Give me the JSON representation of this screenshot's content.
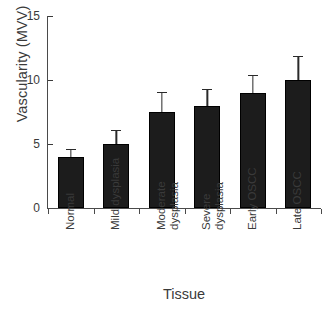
{
  "chart_data": {
    "type": "bar",
    "title": "",
    "xlabel": "Tissue",
    "ylabel": "Vascularity (MVV)",
    "categories": [
      "Normal",
      "Mild dysplasia",
      "Moderate dysplasia",
      "Severe dysplasia",
      "Early OSCC",
      "Late OSCC"
    ],
    "category_lines": [
      [
        "Normal"
      ],
      [
        "Mild dysplasia"
      ],
      [
        "Moderate",
        "dysplasia"
      ],
      [
        "Severe",
        "dysplasia"
      ],
      [
        "Early OSCC"
      ],
      [
        "Late OSCC"
      ]
    ],
    "values": [
      4.0,
      5.0,
      7.5,
      8.0,
      9.0,
      10.0
    ],
    "error_upper": [
      0.5,
      1.0,
      1.5,
      1.2,
      1.3,
      1.8
    ],
    "error_bar_tops": [
      4.5,
      6.0,
      9.0,
      9.2,
      10.3,
      11.8
    ],
    "ylim": [
      0,
      15
    ],
    "yticks": [
      0,
      5,
      10,
      15
    ],
    "ytick_labels": [
      "0",
      "5",
      "10",
      "15"
    ],
    "grid": false,
    "legend": false,
    "bar_color": "#1c1c1c",
    "axis_color": "#4a4a4a",
    "text_color": "#3a3a3a"
  }
}
